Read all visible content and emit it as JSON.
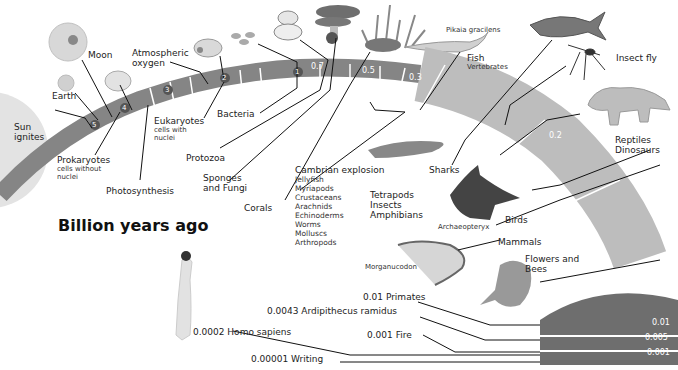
{
  "title": "Billion years ago",
  "colors": {
    "band_dark": "#7d7d7d",
    "band_mid": "#a6a6a6",
    "band_light": "#cfcfcf",
    "arc_dark": "#6f6f6f",
    "sun": "#e0e0e0"
  },
  "band_markers": {
    "m5": "5",
    "m4": "4",
    "m3": "3",
    "m2": "2",
    "m1": "1",
    "m07": "0.7",
    "m05": "0.5",
    "m03": "0.3",
    "m02": "0.2",
    "m01": "0.1",
    "m001": "0.01",
    "m0005": "0.005",
    "m0001": "0.001"
  },
  "events": {
    "sun": {
      "l1": "Sun",
      "l2": "ignites"
    },
    "earth": "Earth",
    "moon": "Moon",
    "oxygen": {
      "l1": "Atmospheric",
      "l2": "oxygen"
    },
    "prokaryotes": {
      "title": "Prokaryotes",
      "s1": "cells without",
      "s2": "nuclei"
    },
    "photosynthesis": "Photosynthesis",
    "eukaryotes": {
      "title": "Eukaryotes",
      "s1": "cells with",
      "s2": "nuclei"
    },
    "bacteria": "Bacteria",
    "protozoa": "Protozoa",
    "sponges": {
      "l1": "Sponges",
      "l2": "and Fungi"
    },
    "corals": "Corals",
    "cambrian": {
      "title": "Cambrian explosion",
      "items": [
        "Jellyfish",
        "Myriapods",
        "Crustaceans",
        "Arachnids",
        "Echinoderms",
        "Worms",
        "Molluscs",
        "Arthropods"
      ]
    },
    "pikaia": "Pikaia gracilens",
    "fish": {
      "l1": "Fish",
      "l2": "Vertebrates"
    },
    "sharks": "Sharks",
    "insect_fly": "Insect fly",
    "tetrapods": {
      "l1": "Tetrapods",
      "l2": "Insects",
      "l3": "Amphibians"
    },
    "reptiles": {
      "l1": "Reptiles",
      "l2": "Dinosaurs"
    },
    "archaeopteryx": "Archaeopteryx",
    "birds": "Birds",
    "mammals": "Mammals",
    "morganucodon": "Morganucodon",
    "flowers": {
      "l1": "Flowers and",
      "l2": "Bees"
    },
    "primates": "0.01 Primates",
    "ardipithecus": "0.0043 Ardipithecus ramidus",
    "fire": "0.001 Fire",
    "homo_sapiens": "0.0002 Homo sapiens",
    "writing": "0.00001 Writing"
  }
}
